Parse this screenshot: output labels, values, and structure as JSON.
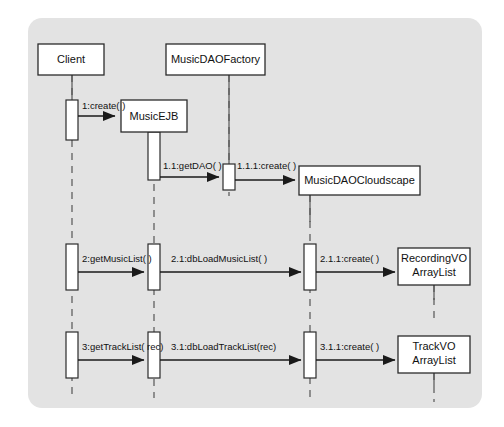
{
  "diagram": {
    "type": "uml-sequence-diagram",
    "title": "",
    "frame": {
      "x": 28,
      "y": 18,
      "width": 454,
      "height": 390,
      "radius": 14,
      "fill": "#e3e3e3"
    },
    "canvas": {
      "width": 504,
      "height": 427,
      "background": "#ffffff"
    },
    "colors": {
      "frame_bg": "#e3e3e3",
      "box_fill": "#ffffff",
      "box_stroke": "#2b2b2b",
      "lifeline_stroke": "#555555",
      "message_stroke": "#1a1a1a",
      "text": "#111111"
    },
    "participants": [
      {
        "id": "client",
        "label": "Client",
        "box": {
          "x": 38,
          "y": 44,
          "width": 66,
          "height": 31
        },
        "lifeline_x": 72,
        "lifeline_from": 75,
        "lifeline_to": 398
      },
      {
        "id": "musicejb",
        "label": "MusicEJB",
        "box": {
          "x": 121,
          "y": 100,
          "width": 66,
          "height": 32
        },
        "lifeline_x": 154,
        "lifeline_from": 132,
        "lifeline_to": 398
      },
      {
        "id": "musicdaofactory",
        "label": "MusicDAOFactory",
        "box": {
          "x": 166,
          "y": 44,
          "width": 99,
          "height": 31
        },
        "lifeline_x": 229,
        "lifeline_from": 75,
        "lifeline_to": 398
      },
      {
        "id": "musicdaocloudscape",
        "label": "MusicDAOCloudscape",
        "box": {
          "x": 299,
          "y": 166,
          "width": 121,
          "height": 29
        },
        "lifeline_x": 310,
        "lifeline_from": 195,
        "lifeline_to": 398
      },
      {
        "id": "recordingvo",
        "label_line1": "RecordingVO",
        "label_line2": "ArrayList",
        "box": {
          "x": 398,
          "y": 248,
          "width": 72,
          "height": 37
        },
        "lifeline_x": 434,
        "lifeline_from": 285,
        "lifeline_to": 322
      },
      {
        "id": "trackvo",
        "label_line1": "TrackVO",
        "label_line2": "ArrayList",
        "box": {
          "x": 398,
          "y": 336,
          "width": 72,
          "height": 37
        },
        "lifeline_x": 434,
        "lifeline_from": 373,
        "lifeline_to": 400
      }
    ],
    "activations": [
      {
        "id": "act-client-1",
        "lifeline": "client",
        "x": 66,
        "y": 100,
        "width": 12,
        "height": 40
      },
      {
        "id": "act-musicejb-1",
        "lifeline": "musicejb",
        "x": 148,
        "y": 132,
        "width": 12,
        "height": 48
      },
      {
        "id": "act-factory-1",
        "lifeline": "musicdaofactory",
        "x": 223,
        "y": 164,
        "width": 12,
        "height": 26
      },
      {
        "id": "act-client-2",
        "lifeline": "client",
        "x": 66,
        "y": 244,
        "width": 12,
        "height": 46
      },
      {
        "id": "act-musicejb-2",
        "lifeline": "musicejb",
        "x": 148,
        "y": 244,
        "width": 12,
        "height": 46
      },
      {
        "id": "act-cloudscape-2",
        "lifeline": "musicdaocloudscape",
        "x": 304,
        "y": 244,
        "width": 12,
        "height": 46
      },
      {
        "id": "act-client-3",
        "lifeline": "client",
        "x": 66,
        "y": 332,
        "width": 12,
        "height": 46
      },
      {
        "id": "act-musicejb-3",
        "lifeline": "musicejb",
        "x": 148,
        "y": 332,
        "width": 12,
        "height": 46
      },
      {
        "id": "act-cloudscape-3",
        "lifeline": "musicdaocloudscape",
        "x": 304,
        "y": 332,
        "width": 12,
        "height": 46
      }
    ],
    "messages": [
      {
        "id": "msg-1",
        "label": "1:create( )",
        "from": "client",
        "to": "musicejb",
        "x1": 78,
        "x2": 118,
        "y": 116,
        "label_x": 82,
        "label_y": 106
      },
      {
        "id": "msg-1-1",
        "label": "1.1:getDAO( )",
        "from": "musicejb",
        "to": "musicdaofactory",
        "x1": 160,
        "x2": 221,
        "y": 177,
        "label_x": 163,
        "label_y": 166
      },
      {
        "id": "msg-1-1-1",
        "label": "1.1.1:create( )",
        "from": "musicdaofactory",
        "to": "musicdaocloudscape",
        "x1": 235,
        "x2": 296,
        "y": 180,
        "label_x": 237,
        "label_y": 166
      },
      {
        "id": "msg-2",
        "label": "2:getMusicList( )",
        "from": "client",
        "to": "musicejb",
        "x1": 78,
        "x2": 146,
        "y": 272,
        "label_x": 82,
        "label_y": 259
      },
      {
        "id": "msg-2-1",
        "label": "2.1:dbLoadMusicList( )",
        "from": "musicejb",
        "to": "musicdaocloudscape",
        "x1": 160,
        "x2": 302,
        "y": 272,
        "label_x": 168,
        "label_y": 259
      },
      {
        "id": "msg-2-1-1",
        "label": "2.1.1:create( )",
        "from": "musicdaocloudscape",
        "to": "recordingvo",
        "x1": 316,
        "x2": 396,
        "y": 272,
        "label_x": 320,
        "label_y": 259
      },
      {
        "id": "msg-3",
        "label": "3:getTrackList( rec)",
        "from": "client",
        "to": "musicejb",
        "x1": 78,
        "x2": 146,
        "y": 360,
        "label_x": 82,
        "label_y": 347
      },
      {
        "id": "msg-3-1",
        "label": "3.1:dbLoadTrackList(rec)",
        "from": "musicejb",
        "to": "musicdaocloudscape",
        "x1": 160,
        "x2": 302,
        "y": 360,
        "label_x": 168,
        "label_y": 347
      },
      {
        "id": "msg-3-1-1",
        "label": "3.1.1:create( )",
        "from": "musicdaocloudscape",
        "to": "trackvo",
        "x1": 316,
        "x2": 396,
        "y": 360,
        "label_x": 320,
        "label_y": 347
      }
    ]
  }
}
